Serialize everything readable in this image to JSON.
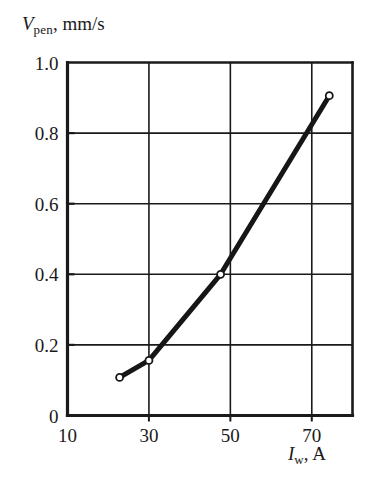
{
  "chart_data": {
    "type": "line",
    "title": "",
    "subtitle": "",
    "xlabel_parts": {
      "symbol": "I",
      "subscript": "w",
      "unit": ", A"
    },
    "ylabel_parts": {
      "symbol": "V",
      "subscript": "pen",
      "unit": ", mm/s"
    },
    "xlabel": "I_w, A",
    "ylabel": "V_pen, mm/s",
    "xlim": [
      10,
      80
    ],
    "ylim": [
      0,
      1.0
    ],
    "xticks": [
      10,
      30,
      50,
      70
    ],
    "xticklabels": [
      "10",
      "30",
      "50",
      "70"
    ],
    "yticks": [
      0,
      0.2,
      0.4,
      0.6,
      0.8,
      1.0
    ],
    "yticklabels": [
      "0",
      "0.2",
      "0.4",
      "0.6",
      "0.8",
      "1.0"
    ],
    "grid": true,
    "grid_x": [
      30,
      50,
      70
    ],
    "grid_y": [
      0.2,
      0.4,
      0.6,
      0.8
    ],
    "legend": null,
    "legend_position": "none",
    "line_color": "#161616",
    "marker": "open-circle",
    "marker_face_color": "#ffffff",
    "series": [
      {
        "name": "penetration rate",
        "x": [
          22.8,
          30.0,
          47.6,
          74.3
        ],
        "y": [
          0.108,
          0.156,
          0.4,
          0.906
        ]
      }
    ],
    "annotations": []
  },
  "axes": {
    "frame_color": "#1a1a1a",
    "background": "#ffffff"
  }
}
